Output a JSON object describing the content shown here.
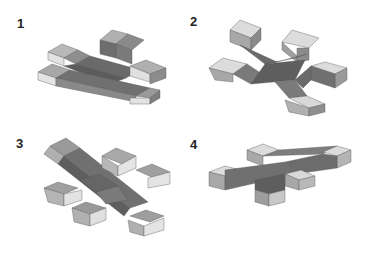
{
  "figures": [
    {
      "label": "1",
      "description": "flat cross of unit cubes with one raised cube, low oblique view"
    },
    {
      "label": "2",
      "description": "six-armed 3D cross of unit cubes"
    },
    {
      "label": "3",
      "description": "six-armed 3D cross of unit cubes, alternate view"
    },
    {
      "label": "4",
      "description": "plus-shaped cross with downward arm"
    }
  ],
  "colors": {
    "top_face": "#dcdcdc",
    "light_side": "#b4b4b4",
    "mid_side": "#8c8c8c",
    "dark_side": "#6a6a6a",
    "darkest": "#555555",
    "edge": "#4a4a4a"
  }
}
